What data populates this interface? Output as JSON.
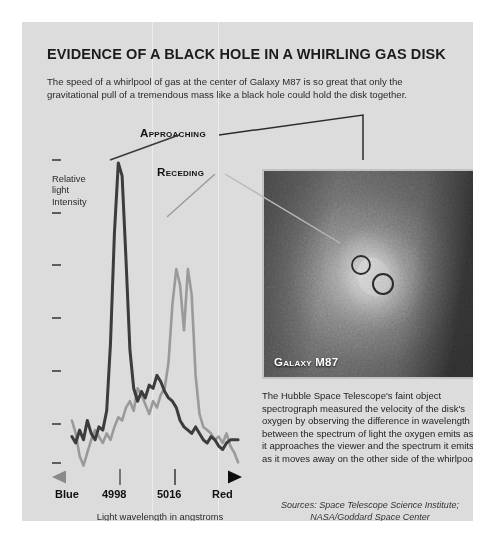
{
  "title": "EVIDENCE OF A BLACK HOLE IN A WHIRLING GAS DISK",
  "deck": "The speed of a whirlpool of gas at the center of Galaxy M87 is so great that only the gravitational pull of a tremendous mass like a black hole could hold the disk together.",
  "chart_axis": {
    "y_label_line1": "Relative",
    "y_label_line2": "light",
    "y_label_line3": "Intensity",
    "x_left": "Blue",
    "x_right": "Red",
    "x_tick1": "4998",
    "x_tick2": "5016",
    "x_caption": "Light wavelength in angstroms"
  },
  "callouts": {
    "approaching": "Approaching",
    "receding": "Receding"
  },
  "photo": {
    "caption": "Galaxy M87"
  },
  "body": "The Hubble Space Telescope's faint object spectrograph measured the velocity of the disk's oxygen by observing the difference in wavelength between the spectrum of light the oxygen emits as it approaches the viewer and the spectrum it emits as it moves away on the other side of the whirlpool.",
  "sources_line1": "Sources: Space Telescope Science Institute;",
  "sources_line2": "NASA/Goddard Space Center",
  "colors": {
    "panel_bg": "#dcdcdc",
    "approaching_curve": "#3c3c3c",
    "receding_curve": "#9a9a9a",
    "axis_blue_end": "#7d7d7d",
    "axis_red_end": "#111111",
    "text": "#1c1c1c"
  },
  "chart_data": {
    "type": "line",
    "title": "",
    "xlabel": "Light wavelength in angstroms",
    "ylabel": "Relative light Intensity",
    "xlim": [
      4985,
      5030
    ],
    "ylim": [
      0,
      100
    ],
    "grid": false,
    "legend_position": "annotations",
    "xticks": [
      "Blue",
      "4998",
      "5016",
      "Red"
    ],
    "xtick_values": [
      4986,
      4998,
      5016,
      5029
    ],
    "yticks": 8,
    "series": [
      {
        "name": "Approaching",
        "color": "#3c3c3c",
        "peak_wavelength": 4998,
        "peak_intensity": 96,
        "x": [
          4986,
          4987,
          4988,
          4989,
          4990,
          4991,
          4992,
          4993,
          4994,
          4995,
          4996,
          4997,
          4998,
          4999,
          5000,
          5001,
          5002,
          5003,
          5004,
          5005,
          5006,
          5007,
          5008,
          5009,
          5010,
          5011,
          5012,
          5013,
          5014,
          5015,
          5016,
          5017,
          5018,
          5019,
          5020,
          5021,
          5022,
          5023,
          5024,
          5025,
          5026,
          5027,
          5028,
          5029
        ],
        "y": [
          11,
          9,
          13,
          10,
          16,
          12,
          10,
          14,
          13,
          19,
          40,
          74,
          96,
          92,
          66,
          38,
          26,
          22,
          25,
          23,
          27,
          26,
          30,
          28,
          25,
          23,
          22,
          20,
          16,
          14,
          13,
          12,
          14,
          12,
          10,
          9,
          11,
          10,
          8,
          7,
          9,
          10,
          10,
          10
        ]
      },
      {
        "name": "Receding",
        "color": "#9a9a9a",
        "peak_wavelength": 5016,
        "peak_intensity": 63,
        "x": [
          4986,
          4987,
          4988,
          4989,
          4990,
          4991,
          4992,
          4993,
          4994,
          4995,
          4996,
          4997,
          4998,
          4999,
          5000,
          5001,
          5002,
          5003,
          5004,
          5005,
          5006,
          5007,
          5008,
          5009,
          5010,
          5011,
          5012,
          5013,
          5014,
          5015,
          5016,
          5017,
          5018,
          5019,
          5020,
          5021,
          5022,
          5023,
          5024,
          5025,
          5026,
          5027,
          5028,
          5029
        ],
        "y": [
          16,
          12,
          5,
          2,
          6,
          10,
          13,
          11,
          9,
          12,
          10,
          14,
          17,
          16,
          20,
          22,
          19,
          26,
          24,
          21,
          18,
          22,
          20,
          24,
          26,
          34,
          52,
          63,
          58,
          44,
          63,
          55,
          30,
          18,
          14,
          13,
          12,
          10,
          11,
          9,
          12,
          8,
          6,
          3
        ]
      }
    ]
  }
}
